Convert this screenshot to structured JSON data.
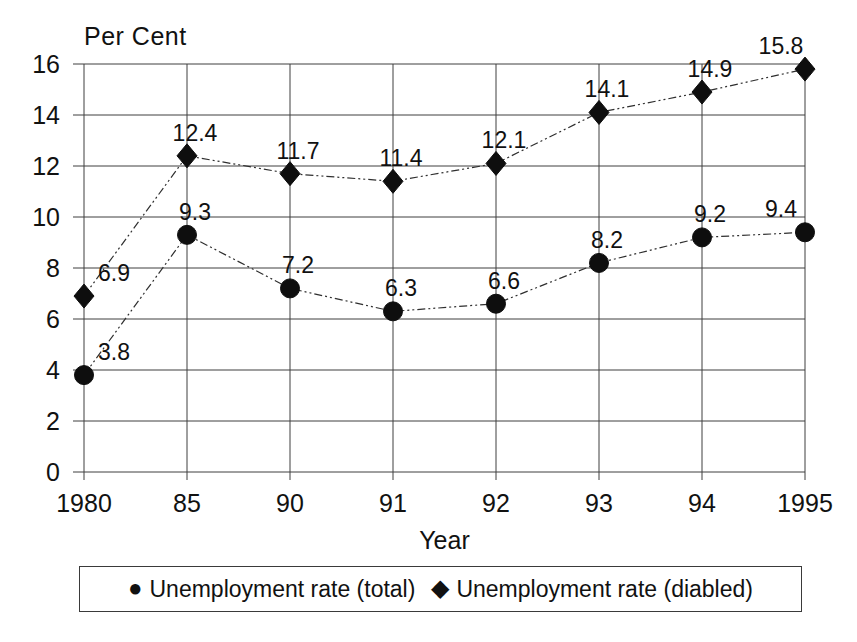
{
  "chart_data": {
    "type": "line",
    "title": "",
    "ylabel": "Per Cent",
    "xlabel": "Year",
    "categories": [
      "1980",
      "85",
      "90",
      "91",
      "92",
      "93",
      "94",
      "1995"
    ],
    "ylim": [
      0,
      16
    ],
    "ytick_step": 2,
    "grid": "both",
    "legend_position": "bottom-boxed",
    "point_labels_visible": true,
    "series": [
      {
        "id": "total",
        "name": "Unemployment rate (total)",
        "marker": "circle",
        "marker_glyph": "●",
        "color": "#0e0e0e",
        "values": [
          3.8,
          9.3,
          7.2,
          6.3,
          6.6,
          8.2,
          9.2,
          9.4
        ]
      },
      {
        "id": "disabled",
        "name": "Unemployment rate (diabled)",
        "marker": "diamond",
        "marker_glyph": "◆",
        "color": "#0e0e0e",
        "values": [
          6.9,
          12.4,
          11.7,
          11.4,
          12.1,
          14.1,
          14.9,
          15.8
        ]
      }
    ]
  },
  "colors": {
    "ink": "#111111",
    "grid": "#3f3f3f",
    "background": "#ffffff"
  }
}
